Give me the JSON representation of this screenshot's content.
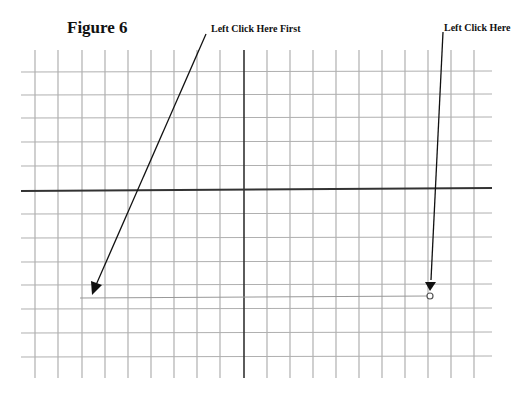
{
  "figure": {
    "title": "Figure 6",
    "annotations": [
      {
        "text": "Left Click Here First",
        "target": "start-point"
      },
      {
        "text": "Left Click Here",
        "target": "end-point"
      }
    ]
  },
  "grid": {
    "line_color": "#a8a8a8",
    "axis_color": "#333333",
    "arrow_color": "#111111",
    "vertical_lines": 20,
    "horizontal_lines": 13
  },
  "line_segment": {
    "start": "first click point (left)",
    "end": "second click point (right, open circle marker)"
  }
}
